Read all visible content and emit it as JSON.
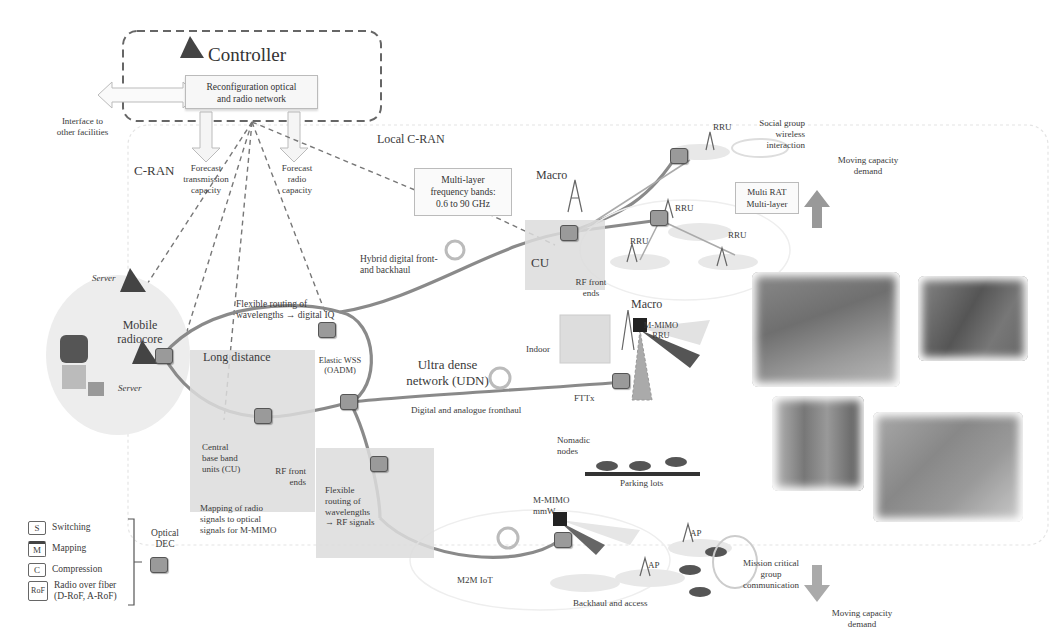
{
  "controller": {
    "title": "Controller",
    "box_text_line1": "Reconfiguration optical",
    "box_text_line2": "and radio network",
    "interface_line1": "Interface to",
    "interface_line2": "other facilities",
    "forecast_tx_line1": "Forecast",
    "forecast_tx_line2": "transmission",
    "forecast_tx_line3": "capacity",
    "forecast_radio_line1": "Forecast",
    "forecast_radio_line2": "radio",
    "forecast_radio_line3": "capacity"
  },
  "regions": {
    "cran": "C-RAN",
    "local_cran": "Local C-RAN",
    "long_distance": "Long distance"
  },
  "core": {
    "server_top": "Server",
    "server_bottom": "Server",
    "radiocore_line1": "Mobile",
    "radiocore_line2": "radiocore"
  },
  "local_cran": {
    "freq_line1": "Multi-layer",
    "freq_line2": "frequency bands:",
    "freq_line3": "0.6 to 90 GHz",
    "macro": "Macro",
    "cu": "CU",
    "rf_front_ends_line1": "RF front",
    "rf_front_ends_line2": "ends",
    "hybrid_line1": "Hybrid digital front-",
    "hybrid_line2": "and backhaul",
    "rru_labels": [
      "RRU",
      "RRU",
      "RRU",
      "RRU"
    ],
    "social_line1": "Social group",
    "social_line2": "wireless",
    "social_line3": "interaction",
    "multirat_line1": "Multi RAT",
    "multirat_line2": "Multi-layer"
  },
  "long_distance": {
    "flex_iq_line1": "Flexible routing of",
    "flex_iq_line2": "wavelengths → digital IQ",
    "wss_line1": "Elastic WSS",
    "wss_line2": "(OADM)",
    "cbu_line1": "Central",
    "cbu_line2": "base band",
    "cbu_line3": "units (CU)",
    "rf_line1": "RF front",
    "rf_line2": "ends",
    "mapping_line1": "Mapping of radio",
    "mapping_line2": "signals to optical",
    "mapping_line3": "signals for M-MIMO",
    "flex_rf_line1": "Flexible",
    "flex_rf_line2": "routing of",
    "flex_rf_line3": "wavelengths",
    "flex_rf_line4": "→ RF signals"
  },
  "udn": {
    "title_line1": "Ultra dense",
    "title_line2": "network (UDN)",
    "fronthaul": "Digital and analogue fronthaul",
    "indoor": "Indoor",
    "fttx": "FTTx",
    "macro": "Macro",
    "mmimo_line1": "M-MIMO",
    "mmimo_line2": "RRU",
    "nomadic_line1": "Nomadic",
    "nomadic_line2": "nodes",
    "parking": "Parking lots"
  },
  "access": {
    "mmimo_line1": "M-MIMO",
    "mmimo_line2": "mmW",
    "m2m": "M2M IoT",
    "ap_labels": [
      "AP",
      "AP"
    ],
    "backhaul": "Backhaul and access",
    "mission_line1": "Mission critical",
    "mission_line2": "group",
    "mission_line3": "communication"
  },
  "demand": {
    "up_line1": "Moving capacity",
    "up_line2": "demand",
    "down_line1": "Moving capacity",
    "down_line2": "demand"
  },
  "legend": {
    "items": [
      {
        "key": "S",
        "label": "Switching"
      },
      {
        "key": "M",
        "label": "Mapping"
      },
      {
        "key": "C",
        "label": "Compression"
      },
      {
        "key": "RoF",
        "label": "Radio over fiber"
      }
    ],
    "rof_sub": "(D-RoF, A-RoF)",
    "dec_line1": "Optical",
    "dec_line2": "DEC"
  },
  "colors": {
    "node_fill": "#9a9a9a",
    "fiber": "#8a8a8a",
    "panel": "#dcdcdc",
    "dashed": "#777777"
  }
}
